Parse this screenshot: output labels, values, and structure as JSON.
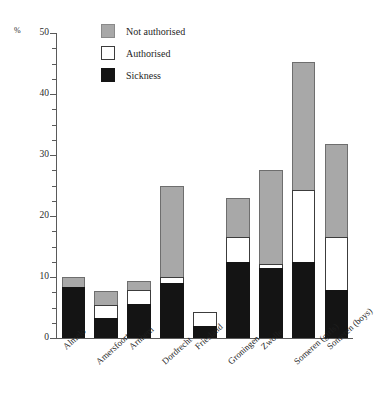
{
  "chart_data": {
    "type": "bar",
    "subtype": "stacked-vertical",
    "title": "",
    "xlabel": "",
    "ylabel": "%",
    "ylim": [
      0,
      50
    ],
    "ytick_values": [
      0,
      10,
      20,
      30,
      40,
      50
    ],
    "ytick_labels": [
      "0",
      "10",
      "20",
      "30",
      "40",
      "50"
    ],
    "minor_tick_step": 2.5,
    "grid": false,
    "legend_position": "top-center",
    "categories": [
      "Almelo",
      "Amersfoort",
      "Arnhem",
      "Dordrecht",
      "Friesland",
      "Groningen",
      "Zwolle",
      "Someren (girls)",
      "Someren (boys)"
    ],
    "series": [
      {
        "name": "Sickness",
        "color": "#141414",
        "values": [
          8.4,
          3.3,
          5.6,
          9.0,
          2.0,
          12.5,
          11.5,
          12.5,
          7.8
        ]
      },
      {
        "name": "Authorised",
        "color": "#ffffff",
        "values": [
          0.0,
          2.1,
          2.3,
          1.0,
          2.2,
          4.0,
          0.6,
          11.8,
          8.7
        ]
      },
      {
        "name": "Not authorised",
        "color": "#a8a8a8",
        "values": [
          1.6,
          2.3,
          1.4,
          15.0,
          0.0,
          6.5,
          15.4,
          20.9,
          15.3
        ]
      }
    ],
    "totals": [
      10.0,
      7.7,
      9.3,
      25.0,
      4.2,
      23.0,
      27.5,
      45.2,
      31.8
    ]
  },
  "legend": {
    "items": [
      {
        "label": "Not authorised",
        "swatch": "grey-swatch"
      },
      {
        "label": "Authorised",
        "swatch": "white-swatch"
      },
      {
        "label": "Sickness",
        "swatch": "black-swatch"
      }
    ]
  },
  "axes": {
    "y_unit_label": "%"
  }
}
